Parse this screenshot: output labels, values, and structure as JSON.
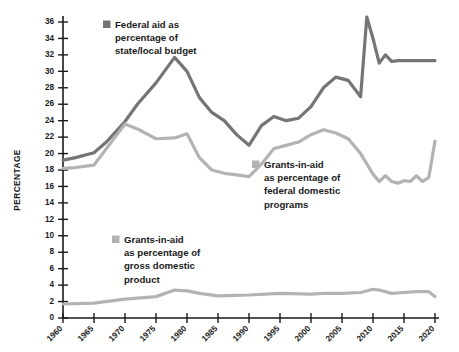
{
  "chart_data": {
    "type": "line",
    "title": "",
    "xlabel": "",
    "ylabel": "PERCENTAGE",
    "ylim": [
      0,
      37
    ],
    "xlim": [
      1960,
      2020
    ],
    "grid": false,
    "legend_position": "inline-annotations",
    "ytick_labels": [
      "0",
      "2",
      "4",
      "6",
      "8",
      "10",
      "12",
      "14",
      "16",
      "18",
      "20",
      "22",
      "24",
      "26",
      "28",
      "30",
      "32",
      "34",
      "36"
    ],
    "ytick_values": [
      0,
      2,
      4,
      6,
      8,
      10,
      12,
      14,
      16,
      18,
      20,
      22,
      24,
      26,
      28,
      30,
      32,
      34,
      36
    ],
    "xtick_labels": [
      "1960",
      "1965",
      "1970",
      "1975",
      "1980",
      "1985",
      "1990",
      "1995",
      "2000",
      "2005",
      "2010",
      "2015",
      "2020"
    ],
    "xtick_values": [
      1960,
      1965,
      1970,
      1975,
      1980,
      1985,
      1990,
      1995,
      2000,
      2005,
      2010,
      2015,
      2020
    ],
    "colors": {
      "federal_aid_state_local": "#757575",
      "grants_federal_domestic": "#b3b3b3",
      "grants_gdp": "#b3b3b3",
      "axis": "#1a1a1a",
      "background": "#ffffff"
    },
    "series": [
      {
        "name": "Federal aid as percentage of state/local budget",
        "color": "#757575",
        "x": [
          1960,
          1962,
          1965,
          1967,
          1970,
          1972,
          1975,
          1978,
          1980,
          1982,
          1984,
          1986,
          1988,
          1990,
          1992,
          1994,
          1996,
          1998,
          2000,
          2002,
          2004,
          2006,
          2008,
          2009,
          2010,
          2011,
          2012,
          2013,
          2014,
          2016,
          2018,
          2020
        ],
        "values": [
          19.2,
          19.5,
          20.1,
          21.4,
          23.9,
          26.0,
          28.6,
          31.7,
          30.0,
          26.8,
          25.0,
          24.0,
          22.3,
          21.0,
          23.4,
          24.5,
          24.0,
          24.3,
          25.7,
          28.0,
          29.3,
          28.9,
          26.9,
          36.6,
          34.0,
          31.0,
          32.0,
          31.2,
          31.3,
          31.3,
          31.3,
          31.3
        ]
      },
      {
        "name": "Grants-in-aid as percentage of federal domestic programs",
        "color": "#b3b3b3",
        "x": [
          1960,
          1962,
          1965,
          1967,
          1970,
          1972,
          1975,
          1978,
          1980,
          1982,
          1984,
          1986,
          1988,
          1990,
          1992,
          1994,
          1996,
          1998,
          2000,
          2002,
          2004,
          2006,
          2008,
          2010,
          2011,
          2012,
          2013,
          2014,
          2015,
          2016,
          2017,
          2018,
          2019,
          2020
        ],
        "values": [
          18.2,
          18.3,
          18.6,
          20.6,
          23.6,
          23.0,
          21.8,
          21.9,
          22.4,
          19.5,
          18.0,
          17.6,
          17.4,
          17.2,
          18.7,
          20.6,
          21.0,
          21.4,
          22.3,
          22.9,
          22.5,
          21.8,
          20.0,
          17.5,
          16.6,
          17.3,
          16.6,
          16.4,
          16.7,
          16.6,
          17.3,
          16.6,
          17.1,
          21.5
        ]
      },
      {
        "name": "Grants-in-aid as percentage of gross domestic product",
        "color": "#b3b3b3",
        "x": [
          1960,
          1965,
          1970,
          1975,
          1978,
          1980,
          1982,
          1985,
          1990,
          1995,
          2000,
          2002,
          2005,
          2008,
          2010,
          2011,
          2013,
          2015,
          2017,
          2019,
          2020
        ],
        "values": [
          1.7,
          1.8,
          2.3,
          2.6,
          3.4,
          3.3,
          3.0,
          2.7,
          2.8,
          3.0,
          2.9,
          3.0,
          3.0,
          3.1,
          3.5,
          3.4,
          3.0,
          3.1,
          3.2,
          3.2,
          2.6
        ]
      }
    ],
    "annotations": [
      {
        "id": "legend-federal-aid",
        "swatch_color": "#757575",
        "lines": [
          "Federal aid as",
          "percentage of",
          "state/local budget"
        ]
      },
      {
        "id": "legend-grants-federal-domestic",
        "swatch_color": "#b3b3b3",
        "lines": [
          "Grants-in-aid",
          "as percentage of",
          "federal domestic",
          "programs"
        ]
      },
      {
        "id": "legend-grants-gdp",
        "swatch_color": "#b3b3b3",
        "lines": [
          "Grants-in-aid",
          "as percentage of",
          "gross domestic",
          "product"
        ]
      }
    ]
  }
}
